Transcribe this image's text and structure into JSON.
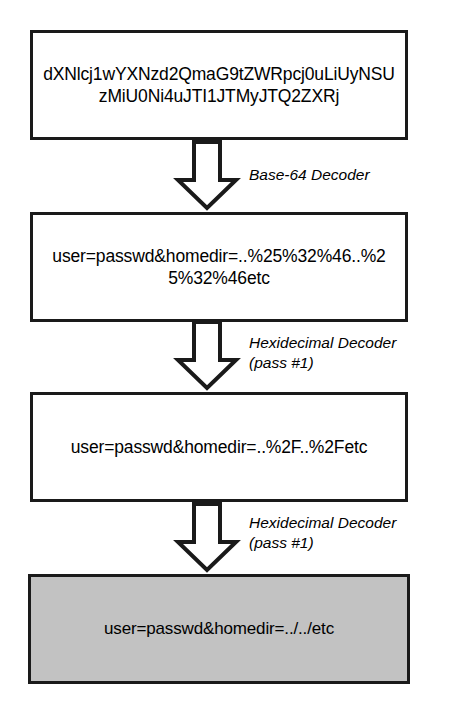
{
  "diagram": {
    "colors": {
      "stroke": "#1a1a1a",
      "box_fill": "#ffffff",
      "final_box_fill": "#c2c2c2",
      "text": "#000000"
    },
    "nodes": [
      {
        "id": "base64-input",
        "name": "base64-encoded-payload",
        "text": "dXNlcj1wYXNzd2QmaG9tZWRpcj0uLiUyNSUzMiU0Ni4uJTI1JTMyJTQ2ZXRj",
        "fill": "white"
      },
      {
        "id": "hex-pass1-input",
        "name": "double-hex-encoded-payload",
        "text": "user=passwd&homedir=..%25%32%46..%25%32%46etc",
        "fill": "white"
      },
      {
        "id": "hex-pass2-input",
        "name": "single-hex-encoded-payload",
        "text": "user=passwd&homedir=..%2F..%2Fetc",
        "fill": "white"
      },
      {
        "id": "final-output",
        "name": "decoded-traversal-payload",
        "text": "user=passwd&homedir=../../etc",
        "fill": "gray"
      }
    ],
    "edges": [
      {
        "id": "edge-1",
        "arrow": "down-block-arrow",
        "label_line1": "Base-64 Decoder",
        "label_line2": ""
      },
      {
        "id": "edge-2",
        "arrow": "down-block-arrow",
        "label_line1": "Hexidecimal Decoder",
        "label_line2": "(pass #1)"
      },
      {
        "id": "edge-3",
        "arrow": "down-block-arrow",
        "label_line1": "Hexidecimal Decoder",
        "label_line2": "(pass #1)"
      }
    ]
  }
}
